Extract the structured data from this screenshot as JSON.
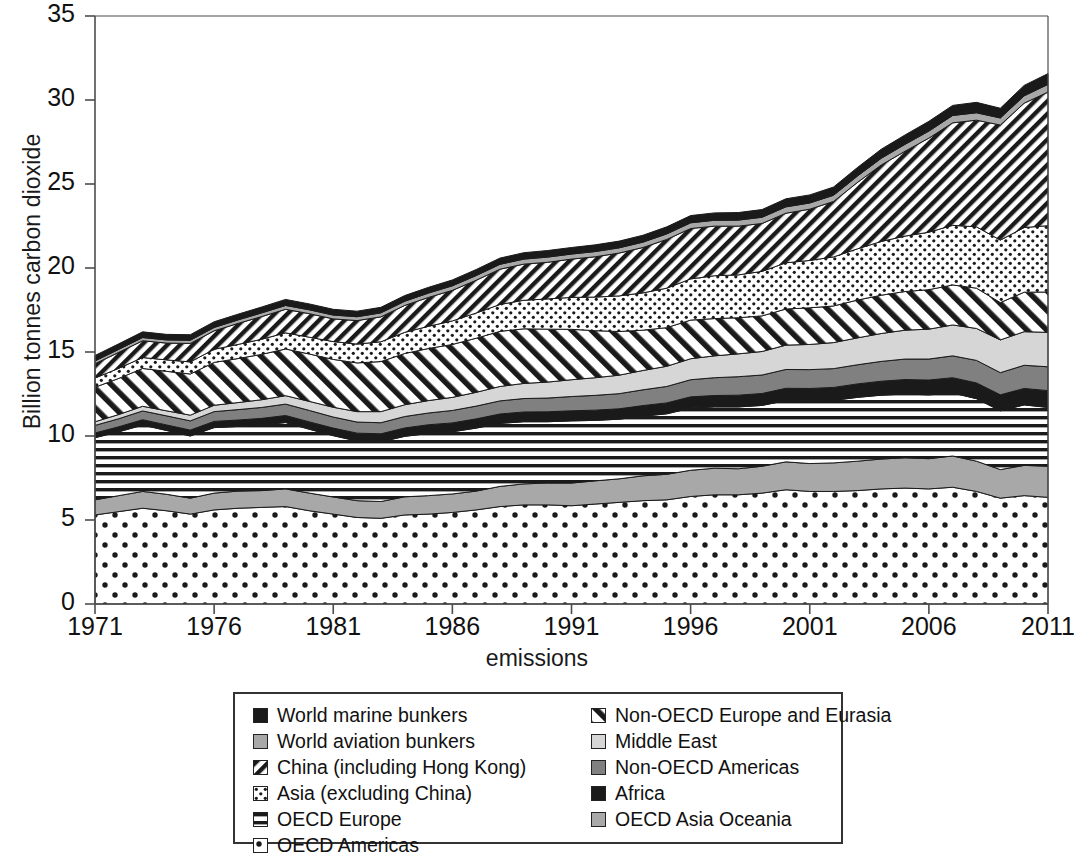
{
  "chart_data": {
    "type": "area",
    "title": "",
    "xlabel": "emissions",
    "ylabel": "Billion tonnes carbon dioxide",
    "ylim": [
      0,
      35
    ],
    "ytick_labels": [
      "0",
      "5",
      "10",
      "15",
      "20",
      "25",
      "30",
      "35"
    ],
    "ytick_values": [
      0,
      5,
      10,
      15,
      20,
      25,
      30,
      35
    ],
    "xlim": [
      1971,
      2011
    ],
    "xtick_labels": [
      "1971",
      "1976",
      "1981",
      "1986",
      "1991",
      "1996",
      "2001",
      "2006",
      "2011"
    ],
    "xtick_values": [
      1971,
      1976,
      1981,
      1986,
      1991,
      1996,
      2001,
      2006,
      2011
    ],
    "grid": false,
    "legend_position": "below-center",
    "stacked": true,
    "x": [
      1971,
      1972,
      1973,
      1974,
      1975,
      1976,
      1977,
      1978,
      1979,
      1980,
      1981,
      1982,
      1983,
      1984,
      1985,
      1986,
      1987,
      1988,
      1989,
      1990,
      1991,
      1992,
      1993,
      1994,
      1995,
      1996,
      1997,
      1998,
      1999,
      2000,
      2001,
      2002,
      2003,
      2004,
      2005,
      2006,
      2007,
      2008,
      2009,
      2010,
      2011
    ],
    "series": [
      {
        "name": "OECD Americas",
        "pattern": "dots-sparse",
        "values": [
          5.3,
          5.5,
          5.7,
          5.55,
          5.35,
          5.6,
          5.7,
          5.75,
          5.8,
          5.55,
          5.35,
          5.15,
          5.1,
          5.3,
          5.35,
          5.45,
          5.6,
          5.8,
          5.9,
          5.9,
          5.85,
          5.95,
          6.05,
          6.15,
          6.2,
          6.4,
          6.5,
          6.5,
          6.6,
          6.8,
          6.7,
          6.7,
          6.75,
          6.85,
          6.9,
          6.85,
          6.95,
          6.7,
          6.3,
          6.45,
          6.35
        ]
      },
      {
        "name": "OECD Asia Oceania",
        "pattern": "solid-gray",
        "values": [
          0.9,
          0.95,
          1.0,
          0.98,
          0.95,
          1.0,
          1.02,
          1.0,
          1.05,
          1.05,
          1.02,
          1.0,
          1.0,
          1.08,
          1.1,
          1.1,
          1.12,
          1.2,
          1.25,
          1.3,
          1.35,
          1.38,
          1.4,
          1.48,
          1.52,
          1.56,
          1.58,
          1.55,
          1.6,
          1.66,
          1.66,
          1.7,
          1.75,
          1.78,
          1.8,
          1.8,
          1.86,
          1.8,
          1.7,
          1.8,
          1.85
        ]
      },
      {
        "name": "OECD Europe",
        "pattern": "horizontal-lines",
        "values": [
          3.7,
          3.8,
          3.95,
          3.8,
          3.7,
          3.9,
          3.85,
          3.9,
          3.95,
          3.8,
          3.65,
          3.55,
          3.55,
          3.6,
          3.7,
          3.7,
          3.75,
          3.75,
          3.7,
          3.65,
          3.7,
          3.6,
          3.55,
          3.55,
          3.6,
          3.7,
          3.65,
          3.68,
          3.62,
          3.65,
          3.72,
          3.72,
          3.8,
          3.8,
          3.8,
          3.8,
          3.75,
          3.72,
          3.5,
          3.6,
          3.5
        ]
      },
      {
        "name": "Africa",
        "pattern": "solid-black",
        "values": [
          0.28,
          0.3,
          0.32,
          0.33,
          0.35,
          0.37,
          0.38,
          0.4,
          0.42,
          0.44,
          0.45,
          0.47,
          0.48,
          0.5,
          0.52,
          0.53,
          0.55,
          0.56,
          0.58,
          0.59,
          0.6,
          0.61,
          0.62,
          0.63,
          0.65,
          0.67,
          0.68,
          0.7,
          0.71,
          0.73,
          0.75,
          0.77,
          0.8,
          0.83,
          0.86,
          0.88,
          0.91,
          0.94,
          0.95,
          0.98,
          1.0
        ]
      },
      {
        "name": "Non-OECD Americas",
        "pattern": "solid-midgray",
        "values": [
          0.45,
          0.48,
          0.52,
          0.54,
          0.55,
          0.58,
          0.62,
          0.65,
          0.68,
          0.68,
          0.66,
          0.66,
          0.66,
          0.68,
          0.7,
          0.74,
          0.76,
          0.78,
          0.8,
          0.82,
          0.85,
          0.88,
          0.9,
          0.94,
          0.98,
          1.02,
          1.06,
          1.1,
          1.1,
          1.12,
          1.12,
          1.12,
          1.14,
          1.18,
          1.22,
          1.25,
          1.3,
          1.34,
          1.32,
          1.38,
          1.42
        ]
      },
      {
        "name": "Middle East",
        "pattern": "solid-lightgray",
        "values": [
          0.22,
          0.25,
          0.28,
          0.3,
          0.34,
          0.38,
          0.42,
          0.46,
          0.5,
          0.54,
          0.58,
          0.62,
          0.66,
          0.7,
          0.74,
          0.78,
          0.82,
          0.86,
          0.9,
          0.95,
          1.0,
          1.05,
          1.1,
          1.15,
          1.2,
          1.25,
          1.3,
          1.36,
          1.4,
          1.45,
          1.5,
          1.55,
          1.6,
          1.66,
          1.72,
          1.78,
          1.84,
          1.9,
          1.95,
          2.0,
          2.05
        ]
      },
      {
        "name": "Non-OECD Europe and Eurasia",
        "pattern": "diag-back",
        "values": [
          2.05,
          2.15,
          2.25,
          2.35,
          2.45,
          2.55,
          2.62,
          2.7,
          2.78,
          2.82,
          2.85,
          2.9,
          2.98,
          3.05,
          3.1,
          3.15,
          3.22,
          3.28,
          3.25,
          3.15,
          3.0,
          2.8,
          2.6,
          2.4,
          2.3,
          2.3,
          2.22,
          2.15,
          2.12,
          2.15,
          2.18,
          2.18,
          2.25,
          2.28,
          2.3,
          2.35,
          2.38,
          2.4,
          2.22,
          2.35,
          2.4
        ]
      },
      {
        "name": "Asia (excluding China)",
        "pattern": "dots-fine",
        "values": [
          0.55,
          0.6,
          0.65,
          0.68,
          0.72,
          0.78,
          0.84,
          0.9,
          0.96,
          1.0,
          1.06,
          1.12,
          1.18,
          1.26,
          1.32,
          1.4,
          1.5,
          1.6,
          1.7,
          1.8,
          1.9,
          2.0,
          2.12,
          2.22,
          2.35,
          2.45,
          2.55,
          2.55,
          2.65,
          2.75,
          2.82,
          2.92,
          3.05,
          3.2,
          3.3,
          3.42,
          3.55,
          3.65,
          3.72,
          3.85,
          3.95
        ]
      },
      {
        "name": "China (including Hong Kong)",
        "pattern": "diag-fwd",
        "values": [
          0.85,
          0.95,
          1.0,
          1.0,
          1.1,
          1.1,
          1.25,
          1.35,
          1.4,
          1.4,
          1.35,
          1.4,
          1.48,
          1.6,
          1.72,
          1.82,
          1.95,
          2.1,
          2.15,
          2.18,
          2.28,
          2.4,
          2.55,
          2.7,
          2.9,
          3.0,
          2.95,
          2.9,
          2.85,
          2.95,
          3.05,
          3.3,
          3.95,
          4.55,
          5.05,
          5.6,
          6.1,
          6.35,
          6.85,
          7.4,
          7.95
        ]
      },
      {
        "name": "World aviation bunkers",
        "pattern": "solid-gray",
        "values": [
          0.17,
          0.18,
          0.19,
          0.19,
          0.19,
          0.2,
          0.21,
          0.22,
          0.23,
          0.23,
          0.23,
          0.23,
          0.24,
          0.25,
          0.26,
          0.27,
          0.28,
          0.29,
          0.3,
          0.31,
          0.3,
          0.31,
          0.31,
          0.32,
          0.33,
          0.34,
          0.35,
          0.36,
          0.37,
          0.38,
          0.37,
          0.37,
          0.38,
          0.4,
          0.41,
          0.42,
          0.44,
          0.44,
          0.42,
          0.44,
          0.46
        ]
      },
      {
        "name": "World marine bunkers",
        "pattern": "solid-black",
        "values": [
          0.32,
          0.33,
          0.34,
          0.33,
          0.33,
          0.34,
          0.34,
          0.35,
          0.36,
          0.35,
          0.34,
          0.33,
          0.33,
          0.34,
          0.34,
          0.35,
          0.36,
          0.37,
          0.38,
          0.39,
          0.39,
          0.4,
          0.4,
          0.41,
          0.42,
          0.43,
          0.44,
          0.45,
          0.46,
          0.48,
          0.48,
          0.49,
          0.51,
          0.54,
          0.56,
          0.58,
          0.6,
          0.62,
          0.58,
          0.62,
          0.64
        ]
      }
    ]
  },
  "legend": {
    "column1": [
      {
        "label": "World marine bunkers",
        "pattern": "solid-black"
      },
      {
        "label": "World aviation bunkers",
        "pattern": "solid-gray"
      },
      {
        "label": "China (including Hong Kong)",
        "pattern": "diag-fwd"
      },
      {
        "label": "Asia (excluding China)",
        "pattern": "dots-fine"
      },
      {
        "label": "OECD Europe",
        "pattern": "horizontal-lines"
      },
      {
        "label": "OECD Americas",
        "pattern": "dots-sparse"
      }
    ],
    "column2": [
      {
        "label": "Non-OECD Europe and Eurasia",
        "pattern": "diag-back"
      },
      {
        "label": "Middle East",
        "pattern": "solid-lightgray"
      },
      {
        "label": "Non-OECD Americas",
        "pattern": "solid-midgray"
      },
      {
        "label": "Africa",
        "pattern": "solid-black"
      },
      {
        "label": "OECD Asia Oceania",
        "pattern": "solid-gray"
      }
    ]
  },
  "colors": {
    "solid-black": "#1a1a1a",
    "solid-gray": "#a8a8a8",
    "solid-midgray": "#808080",
    "solid-lightgray": "#d6d6d6",
    "axis": "#4d4d4d",
    "text": "#111111",
    "background": "#ffffff"
  }
}
